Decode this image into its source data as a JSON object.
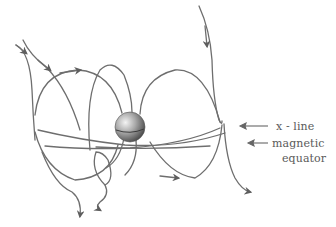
{
  "diagram": {
    "labels": {
      "x_line": "x - line",
      "magnetic_equator_line1": "magnetic",
      "magnetic_equator_line2": "equator"
    },
    "colors": {
      "line": "#6a6a6a",
      "text": "#5a5a5a",
      "sphere_light": "#e8e8e8",
      "sphere_dark": "#4a4a4a",
      "background": "#ffffff"
    },
    "elements": {
      "planet": "shaded sphere at center",
      "field_lines": "curved magnetic field lines with arrowheads",
      "x_point": "reconnection X-line to the right of planet"
    }
  }
}
